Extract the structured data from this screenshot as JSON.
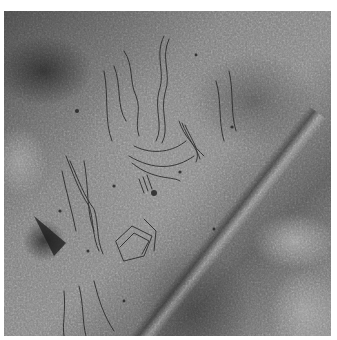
{
  "image": {
    "subject": "rock surface with engraved petroglyph figures",
    "palette": {
      "background": "#ffffff",
      "rock_dark": "#3a3a3a",
      "rock_mid": "#7d7d7d",
      "rock_light": "#c8c8c8",
      "engraving_line": "#2a2a2a"
    }
  }
}
